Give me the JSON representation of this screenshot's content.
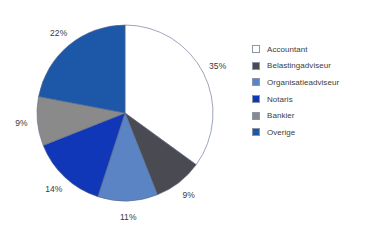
{
  "chart_data": {
    "type": "pie",
    "title": "",
    "subtitle": "",
    "xlabel": "",
    "ylabel": "",
    "legend_position": "right",
    "grid": false,
    "start_angle_deg": 0,
    "direction": "clockwise",
    "categories": [
      "Accountant",
      "Belastingadviseur",
      "Organisatieadviseur",
      "Notaris",
      "Bankier",
      "Overige"
    ],
    "values": [
      35,
      9,
      11,
      14,
      9,
      22
    ],
    "data_labels": [
      "35%",
      "9%",
      "11%",
      "14%",
      "9%",
      "22%"
    ],
    "colors": [
      "#ffffff",
      "#4a4a52",
      "#5b84c4",
      "#1037b8",
      "#8a8a8a",
      "#1c57a8"
    ],
    "slices": [
      {
        "label": "Accountant",
        "value": 35,
        "data_label": "35%",
        "color": "#ffffff"
      },
      {
        "label": "Belastingadviseur",
        "value": 9,
        "data_label": "9%",
        "color": "#4a4a52"
      },
      {
        "label": "Organisatieadviseur",
        "value": 11,
        "data_label": "11%",
        "color": "#5b84c4"
      },
      {
        "label": "Notaris",
        "value": 14,
        "data_label": "14%",
        "color": "#1037b8"
      },
      {
        "label": "Bankier",
        "value": 9,
        "data_label": "9%",
        "color": "#8a8a8a"
      },
      {
        "label": "Overige",
        "value": 22,
        "data_label": "22%",
        "color": "#1c57a8"
      }
    ]
  },
  "legend": {
    "items": [
      {
        "label": "Accountant",
        "color": "#ffffff"
      },
      {
        "label": "Belastingadviseur",
        "color": "#4a4a52"
      },
      {
        "label": "Organisatieadviseur",
        "color": "#5b84c4"
      },
      {
        "label": "Notaris",
        "color": "#1037b8"
      },
      {
        "label": "Bankier",
        "color": "#8a8a8a"
      },
      {
        "label": "Overige",
        "color": "#1c57a8"
      }
    ]
  },
  "style": {
    "background": "#ffffff",
    "label_color": "#3a3a3a",
    "legend_text_color": "#3d3d3d",
    "slice_outline": "#5b6a8a"
  },
  "geometry": {
    "cx": 125,
    "cy": 113,
    "r": 88,
    "label_radius": 104
  }
}
